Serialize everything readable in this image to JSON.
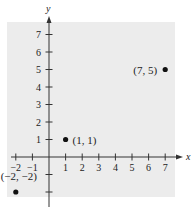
{
  "chart_data": {
    "type": "scatter",
    "title": "",
    "xlabel": "x",
    "ylabel": "y",
    "xlim": [
      -2,
      7
    ],
    "ylim": [
      -2,
      7
    ],
    "x_ticks": [
      -2,
      -1,
      1,
      2,
      3,
      4,
      5,
      6,
      7
    ],
    "y_ticks": [
      1,
      2,
      3,
      4,
      5,
      6,
      7
    ],
    "grid": false,
    "legend": null,
    "points": [
      {
        "x": 7,
        "y": 5,
        "label": "(7, 5)"
      },
      {
        "x": 1,
        "y": 1,
        "label": "(1, 1)"
      },
      {
        "x": -2,
        "y": -2,
        "label": "(−2, −2)"
      }
    ],
    "background_color": "#ececec",
    "point_color": "#111111",
    "axis_color": "#333333"
  },
  "geometry": {
    "panel": {
      "x": 7,
      "y": 22,
      "w": 168,
      "h": 175
    },
    "origin": {
      "px": 49,
      "py": 157
    },
    "unit_x": 16.6,
    "unit_y": 17.5
  }
}
